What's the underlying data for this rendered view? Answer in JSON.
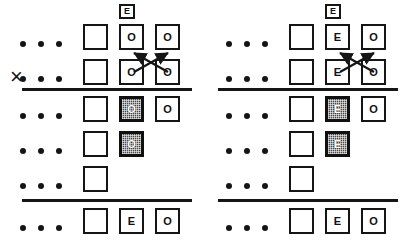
{
  "figure": {
    "caption_symbol": "×",
    "panels": [
      {
        "id": "left",
        "header_label": "E",
        "multiply_mark": "×",
        "rows": [
          {
            "id": "r1",
            "ellipsis": "•••",
            "cells": [
              {
                "label": "",
                "state": "empty"
              },
              {
                "label": "O",
                "state": "plain"
              },
              {
                "label": "O",
                "state": "plain"
              }
            ]
          },
          {
            "id": "r2",
            "ellipsis": "•••",
            "cells": [
              {
                "label": "",
                "state": "empty"
              },
              {
                "label": "O",
                "state": "plain"
              },
              {
                "label": "O",
                "state": "plain"
              }
            ]
          },
          {
            "id": "r3",
            "ellipsis": "•••",
            "cells": [
              {
                "label": "",
                "state": "empty"
              },
              {
                "label": "O",
                "state": "shaded"
              },
              {
                "label": "O",
                "state": "plain"
              }
            ]
          },
          {
            "id": "r4",
            "ellipsis": "•••",
            "cells": [
              {
                "label": "",
                "state": "empty"
              },
              {
                "label": "O",
                "state": "shaded"
              }
            ]
          },
          {
            "id": "r5",
            "ellipsis": "•••",
            "cells": [
              {
                "label": "",
                "state": "empty"
              }
            ]
          },
          {
            "id": "r6",
            "ellipsis": "•••",
            "cells": [
              {
                "label": "",
                "state": "empty"
              },
              {
                "label": "E",
                "state": "plain"
              },
              {
                "label": "O",
                "state": "plain"
              }
            ]
          }
        ]
      },
      {
        "id": "right",
        "header_label": "E",
        "multiply_mark": "",
        "rows": [
          {
            "id": "r1",
            "ellipsis": "•••",
            "cells": [
              {
                "label": "",
                "state": "empty"
              },
              {
                "label": "E",
                "state": "plain"
              },
              {
                "label": "O",
                "state": "plain"
              }
            ]
          },
          {
            "id": "r2",
            "ellipsis": "•••",
            "cells": [
              {
                "label": "",
                "state": "empty"
              },
              {
                "label": "E",
                "state": "plain"
              },
              {
                "label": "O",
                "state": "plain"
              }
            ]
          },
          {
            "id": "r3",
            "ellipsis": "•••",
            "cells": [
              {
                "label": "",
                "state": "empty"
              },
              {
                "label": "E",
                "state": "shaded"
              },
              {
                "label": "O",
                "state": "plain"
              }
            ]
          },
          {
            "id": "r4",
            "ellipsis": "•••",
            "cells": [
              {
                "label": "",
                "state": "empty"
              },
              {
                "label": "E",
                "state": "shaded"
              }
            ]
          },
          {
            "id": "r5",
            "ellipsis": "•••",
            "cells": [
              {
                "label": "",
                "state": "empty"
              }
            ]
          },
          {
            "id": "r6",
            "ellipsis": "•••",
            "cells": [
              {
                "label": "",
                "state": "empty"
              },
              {
                "label": "E",
                "state": "plain"
              },
              {
                "label": "O",
                "state": "plain"
              }
            ]
          }
        ]
      }
    ],
    "colors": {
      "ink": "#151515",
      "paper": "#ffffff",
      "shade_fill": "#4a4a4a"
    }
  }
}
